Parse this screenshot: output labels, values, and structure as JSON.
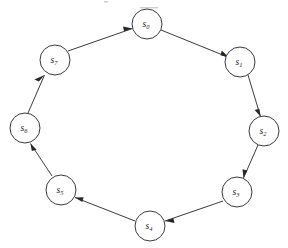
{
  "diagram": {
    "type": "directed-cycle-graph",
    "background_color": "#ffffff",
    "stroke_color": "#3a3a42",
    "node_fill_color": "#ffffff",
    "arrowhead_color": "#26262c",
    "label_color": "#1c1c22",
    "node_radius": 15,
    "direction": "clockwise",
    "nodes": [
      {
        "id": "s0",
        "base": "s",
        "subscript": "0",
        "label": "s0",
        "cx": 147,
        "cy": 24
      },
      {
        "id": "s1",
        "base": "s",
        "subscript": "1",
        "label": "s1",
        "cx": 240,
        "cy": 62
      },
      {
        "id": "s2",
        "base": "s",
        "subscript": "2",
        "label": "s2",
        "cx": 264,
        "cy": 131
      },
      {
        "id": "s3",
        "base": "s",
        "subscript": "3",
        "label": "s3",
        "cx": 237,
        "cy": 192
      },
      {
        "id": "s4",
        "base": "s",
        "subscript": "4",
        "label": "s4",
        "cx": 150,
        "cy": 226
      },
      {
        "id": "s5",
        "base": "s",
        "subscript": "5",
        "label": "s5",
        "cx": 61,
        "cy": 190
      },
      {
        "id": "s6",
        "base": "s",
        "subscript": "6",
        "label": "s6",
        "cx": 25,
        "cy": 128
      },
      {
        "id": "s7",
        "base": "s",
        "subscript": "7",
        "label": "s7",
        "cx": 55,
        "cy": 60
      }
    ],
    "edges": [
      {
        "id": "e0",
        "from": "s0",
        "to": "s1",
        "x1": 161,
        "y1": 30,
        "x2": 227,
        "y2": 57
      },
      {
        "id": "e1",
        "from": "s1",
        "to": "s2",
        "x1": 248,
        "y1": 75,
        "x2": 260,
        "y2": 115
      },
      {
        "id": "e2",
        "from": "s2",
        "to": "s3",
        "x1": 258,
        "y1": 145,
        "x2": 243,
        "y2": 177
      },
      {
        "id": "e3",
        "from": "s3",
        "to": "s4",
        "x1": 223,
        "y1": 201,
        "x2": 166,
        "y2": 221
      },
      {
        "id": "e4",
        "from": "s4",
        "to": "s5",
        "x1": 135,
        "y1": 221,
        "x2": 76,
        "y2": 198
      },
      {
        "id": "e5",
        "from": "s5",
        "to": "s6",
        "x1": 52,
        "y1": 176,
        "x2": 31,
        "y2": 144
      },
      {
        "id": "e6",
        "from": "s6",
        "to": "s7",
        "x1": 28,
        "y1": 113,
        "x2": 45,
        "y2": 76
      },
      {
        "id": "e7",
        "from": "s7",
        "to": "s0",
        "x1": 68,
        "y1": 51,
        "x2": 131,
        "y2": 29
      }
    ]
  }
}
